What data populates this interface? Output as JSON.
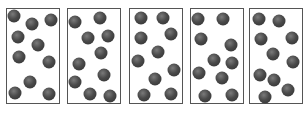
{
  "diagram": {
    "ball_color": "#4a4a4a",
    "border_color": "#555555",
    "boxes": [
      {
        "left": 6,
        "count": 10,
        "balls": [
          [
            14,
            16
          ],
          [
            32,
            24
          ],
          [
            51,
            20
          ],
          [
            18,
            37
          ],
          [
            38,
            45
          ],
          [
            19,
            57
          ],
          [
            49,
            62
          ],
          [
            30,
            82
          ],
          [
            15,
            93
          ],
          [
            49,
            94
          ]
        ]
      },
      {
        "left": 67,
        "count": 10,
        "balls": [
          [
            75,
            22
          ],
          [
            100,
            18
          ],
          [
            88,
            38
          ],
          [
            108,
            36
          ],
          [
            101,
            53
          ],
          [
            79,
            64
          ],
          [
            104,
            75
          ],
          [
            75,
            82
          ],
          [
            90,
            94
          ],
          [
            110,
            96
          ]
        ]
      },
      {
        "left": 129,
        "count": 10,
        "balls": [
          [
            141,
            18
          ],
          [
            163,
            18
          ],
          [
            141,
            38
          ],
          [
            171,
            34
          ],
          [
            158,
            52
          ],
          [
            138,
            61
          ],
          [
            174,
            70
          ],
          [
            155,
            79
          ],
          [
            144,
            95
          ],
          [
            171,
            94
          ]
        ]
      },
      {
        "left": 190,
        "count": 10,
        "balls": [
          [
            198,
            19
          ],
          [
            223,
            19
          ],
          [
            201,
            39
          ],
          [
            231,
            45
          ],
          [
            214,
            60
          ],
          [
            232,
            63
          ],
          [
            199,
            73
          ],
          [
            222,
            78
          ],
          [
            205,
            96
          ],
          [
            232,
            95
          ]
        ]
      },
      {
        "left": 249,
        "count": 10,
        "balls": [
          [
            259,
            19
          ],
          [
            279,
            21
          ],
          [
            261,
            39
          ],
          [
            292,
            38
          ],
          [
            273,
            54
          ],
          [
            293,
            62
          ],
          [
            260,
            75
          ],
          [
            274,
            80
          ],
          [
            288,
            90
          ],
          [
            265,
            97
          ]
        ]
      }
    ]
  }
}
